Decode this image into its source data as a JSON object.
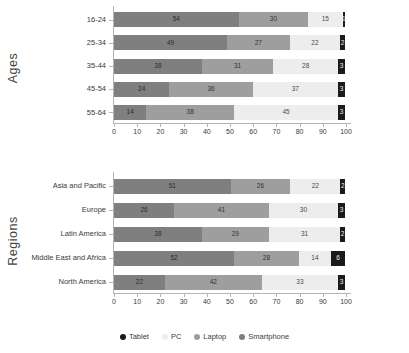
{
  "legend": {
    "position": "bottom",
    "items": [
      {
        "label": "Tablet",
        "color": "#1b1b1b",
        "key": "tablet"
      },
      {
        "label": "PC",
        "color": "#ededed",
        "key": "pc"
      },
      {
        "label": "Laptop",
        "color": "#9e9e9e",
        "key": "laptop"
      },
      {
        "label": "Smartphone",
        "color": "#7f7f7f",
        "key": "smartphone"
      }
    ]
  },
  "charts": [
    {
      "id": "ages",
      "group_title": "Ages",
      "xlabel": "",
      "ylabel": "Ages"
    },
    {
      "id": "regions",
      "group_title": "Regions",
      "xlabel": "",
      "ylabel": "Regions"
    }
  ],
  "axis": {
    "ticks": [
      "0",
      "10",
      "20",
      "30",
      "40",
      "50",
      "60",
      "70",
      "80",
      "90",
      "100"
    ],
    "min": 0,
    "max": 100,
    "step": 10
  },
  "chart_data": [
    {
      "type": "bar",
      "orientation": "horizontal",
      "stacked": true,
      "title": "",
      "xlabel": "",
      "ylabel": "Ages",
      "xlim": [
        0,
        100
      ],
      "grid": false,
      "legend_position": "bottom",
      "categories": [
        "16-24",
        "25-34",
        "35-44",
        "45-54",
        "55-64"
      ],
      "series": [
        {
          "name": "Smartphone",
          "color": "#7f7f7f",
          "values": [
            54,
            49,
            38,
            24,
            14
          ]
        },
        {
          "name": "Laptop",
          "color": "#9e9e9e",
          "values": [
            30,
            27,
            31,
            36,
            38
          ]
        },
        {
          "name": "PC",
          "color": "#ededed",
          "values": [
            15,
            22,
            28,
            37,
            45
          ]
        },
        {
          "name": "Tablet",
          "color": "#1b1b1b",
          "values": [
            1,
            2,
            3,
            3,
            3
          ]
        }
      ]
    },
    {
      "type": "bar",
      "orientation": "horizontal",
      "stacked": true,
      "title": "",
      "xlabel": "",
      "ylabel": "Regions",
      "xlim": [
        0,
        100
      ],
      "grid": false,
      "legend_position": "bottom",
      "categories": [
        "Asia and Pacific",
        "Europe",
        "Latin America",
        "Middle East and Africa",
        "North America"
      ],
      "series": [
        {
          "name": "Smartphone",
          "color": "#7f7f7f",
          "values": [
            51,
            26,
            38,
            52,
            22
          ]
        },
        {
          "name": "Laptop",
          "color": "#9e9e9e",
          "values": [
            26,
            41,
            29,
            28,
            42
          ]
        },
        {
          "name": "PC",
          "color": "#ededed",
          "values": [
            22,
            30,
            31,
            14,
            33
          ]
        },
        {
          "name": "Tablet",
          "color": "#1b1b1b",
          "values": [
            2,
            3,
            2,
            6,
            3
          ]
        }
      ]
    }
  ]
}
